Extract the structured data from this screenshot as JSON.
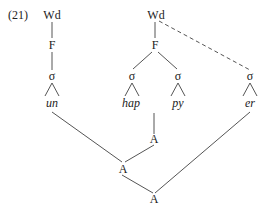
{
  "example_number": "(21)",
  "tree": {
    "left_word": {
      "wd": "Wd",
      "foot": "F",
      "syllable": "σ",
      "segment": "un"
    },
    "right_word": {
      "wd": "Wd",
      "foot": "F",
      "syllables": [
        {
          "sigma": "σ",
          "segment": "hap"
        },
        {
          "sigma": "σ",
          "segment": "py"
        }
      ],
      "extra_syllable": {
        "sigma": "σ",
        "segment": "er",
        "link": "dashed"
      }
    },
    "morphology": {
      "a_top": "A",
      "a_mid": "A",
      "a_bottom": "A"
    }
  }
}
